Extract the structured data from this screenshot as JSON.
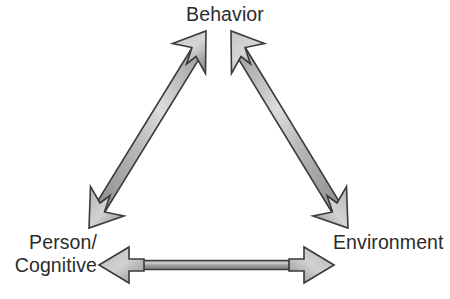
{
  "diagram": {
    "type": "triangle-cycle",
    "nodes": [
      {
        "id": "behavior",
        "label": "Behavior",
        "position": "top"
      },
      {
        "id": "person_cognitive",
        "label_line1": "Person/",
        "label_line2": "Cognitive",
        "label": "Person/\nCognitive",
        "position": "bottom-left"
      },
      {
        "id": "environment",
        "label": "Environment",
        "position": "bottom-right"
      }
    ],
    "connectors": [
      {
        "id": "behavior-person",
        "from": "behavior",
        "to": "person_cognitive",
        "arrowheads": "both",
        "style": "double-headed-chevron"
      },
      {
        "id": "behavior-environment",
        "from": "behavior",
        "to": "environment",
        "arrowheads": "both",
        "style": "double-headed-chevron"
      },
      {
        "id": "person-environment",
        "from": "person_cognitive",
        "to": "environment",
        "arrowheads": "both",
        "style": "double-headed-chevron"
      }
    ],
    "colors": {
      "text": "#2b2b2b",
      "background": "#ffffff",
      "arrow_outline": "#3a3a3a",
      "arrow_fill_light": "#dcdcdc",
      "arrow_fill_mid": "#a9a9a9",
      "arrow_fill_dark": "#7e7e7e"
    }
  }
}
